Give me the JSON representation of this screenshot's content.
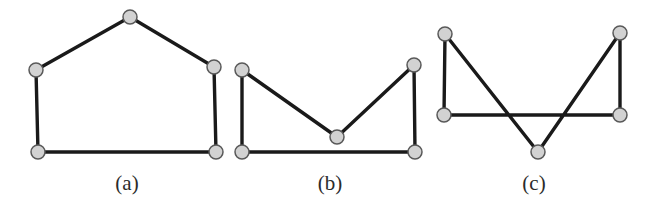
{
  "figure": {
    "background_color": "#ffffff",
    "edge_color": "#1a1a1a",
    "vertex_fill_color": "#d2d2d2",
    "vertex_stroke_color": "#595959",
    "caption_color": "#2b2b2b",
    "edge_width": 3.4,
    "vertex_radius": 7
  },
  "panels": [
    {
      "id": "panel-a",
      "caption": "(a)",
      "caption_x": 127,
      "caption_y": 190,
      "shape": "convex-pentagon",
      "closed": true,
      "vertices": [
        {
          "name": "apex",
          "x": 130,
          "y": 17
        },
        {
          "name": "upper-right",
          "x": 214,
          "y": 67
        },
        {
          "name": "lower-right",
          "x": 216,
          "y": 152
        },
        {
          "name": "lower-left",
          "x": 38,
          "y": 152
        },
        {
          "name": "upper-left",
          "x": 36,
          "y": 70
        }
      ]
    },
    {
      "id": "panel-b",
      "caption": "(b)",
      "caption_x": 330,
      "caption_y": 190,
      "shape": "nonconvex-pentagon",
      "closed": true,
      "vertices": [
        {
          "name": "top-left",
          "x": 242,
          "y": 70
        },
        {
          "name": "notch-bottom",
          "x": 337,
          "y": 137
        },
        {
          "name": "top-right",
          "x": 414,
          "y": 65
        },
        {
          "name": "bottom-right",
          "x": 415,
          "y": 152
        },
        {
          "name": "bottom-left",
          "x": 242,
          "y": 152
        }
      ]
    },
    {
      "id": "panel-c",
      "caption": "(c)",
      "caption_x": 534,
      "caption_y": 190,
      "shape": "self-intersecting-pentagon",
      "closed": true,
      "vertices": [
        {
          "name": "top-left",
          "x": 445,
          "y": 34
        },
        {
          "name": "bottom-apex",
          "x": 538,
          "y": 152
        },
        {
          "name": "top-right",
          "x": 620,
          "y": 33
        },
        {
          "name": "mid-right",
          "x": 620,
          "y": 115
        },
        {
          "name": "mid-left",
          "x": 444,
          "y": 115
        }
      ]
    }
  ]
}
